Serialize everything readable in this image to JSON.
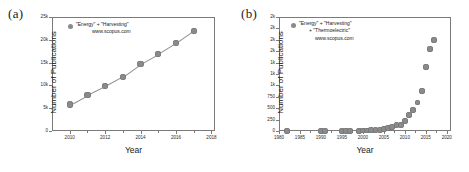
{
  "figure": {
    "panels": [
      {
        "label": "(a)",
        "legend": [
          "\"Energy\" + \"Harvesting\"",
          "www.scopus.com"
        ],
        "xlabel": "Year",
        "ylabel": "Number of Publications"
      },
      {
        "label": "(b)",
        "legend": [
          "\"Energy\" + \"Harvesting\"",
          "+ \"Thermoelectric\"",
          "www.scopus.com"
        ],
        "xlabel": "Year",
        "ylabel": "Number of Publications"
      }
    ],
    "marker_color": "#8a8a8a",
    "axis_color": "#7a7a7a"
  },
  "chart_data": [
    {
      "type": "scatter",
      "panel": "(a)",
      "title": "",
      "xlabel": "Year",
      "ylabel": "Number of Publications",
      "legend": [
        "\"Energy\" + \"Harvesting\"",
        "www.scopus.com"
      ],
      "legend_position": "top-left",
      "grid": false,
      "connected_line": true,
      "xlim": [
        2009,
        2018.2
      ],
      "ylim": [
        0,
        25000
      ],
      "xticks": [
        2010,
        2012,
        2014,
        2016,
        2018
      ],
      "xtick_labels": [
        "2010",
        "2012",
        "2014",
        "2016",
        "2018"
      ],
      "yticks": [
        0,
        5000,
        10000,
        15000,
        20000,
        25000
      ],
      "ytick_labels": [
        "0",
        "5k",
        "10k",
        "15k",
        "20k",
        "25k"
      ],
      "x": [
        2010,
        2011,
        2012,
        2013,
        2014,
        2015,
        2016,
        2017
      ],
      "values": [
        5800,
        7900,
        9800,
        11900,
        14700,
        16900,
        19300,
        22000
      ]
    },
    {
      "type": "scatter",
      "panel": "(b)",
      "title": "",
      "xlabel": "Year",
      "ylabel": "Number of Publications",
      "legend": [
        "\"Energy\" + \"Harvesting\"",
        "+ \"Thermoelectric\"",
        "www.scopus.com"
      ],
      "legend_position": "top-left",
      "grid": false,
      "connected_line": false,
      "xlim": [
        1980,
        2021
      ],
      "ylim": [
        0,
        2500
      ],
      "xticks": [
        1980,
        1985,
        1990,
        1995,
        2000,
        2005,
        2010,
        2015,
        2020
      ],
      "xtick_labels": [
        "1980",
        "1985",
        "1990",
        "1995",
        "2000",
        "2005",
        "2010",
        "2015",
        "2020"
      ],
      "yticks": [
        0,
        250,
        500,
        750,
        1000,
        1250,
        1500,
        1750,
        2000,
        2250,
        2500
      ],
      "ytick_labels": [
        "0",
        "250",
        "500",
        "750",
        "1k",
        "1k",
        "1k",
        "2k",
        "2k",
        "2k",
        "2k"
      ],
      "ytick_labels_shown": [
        "0",
        "250",
        "500",
        "750",
        "1k",
        "1k",
        "2k",
        "2k"
      ],
      "x": [
        1982,
        1990,
        1991,
        1995,
        1996,
        1997,
        1999,
        2000,
        2001,
        2002,
        2003,
        2004,
        2005,
        2006,
        2007,
        2008,
        2009,
        2010,
        2011,
        2012,
        2013,
        2014,
        2015,
        2016,
        2017
      ],
      "values": [
        2,
        3,
        4,
        5,
        6,
        6,
        8,
        10,
        12,
        14,
        18,
        25,
        38,
        60,
        90,
        125,
        135,
        215,
        350,
        455,
        625,
        880,
        1400,
        1790,
        2000
      ]
    }
  ]
}
